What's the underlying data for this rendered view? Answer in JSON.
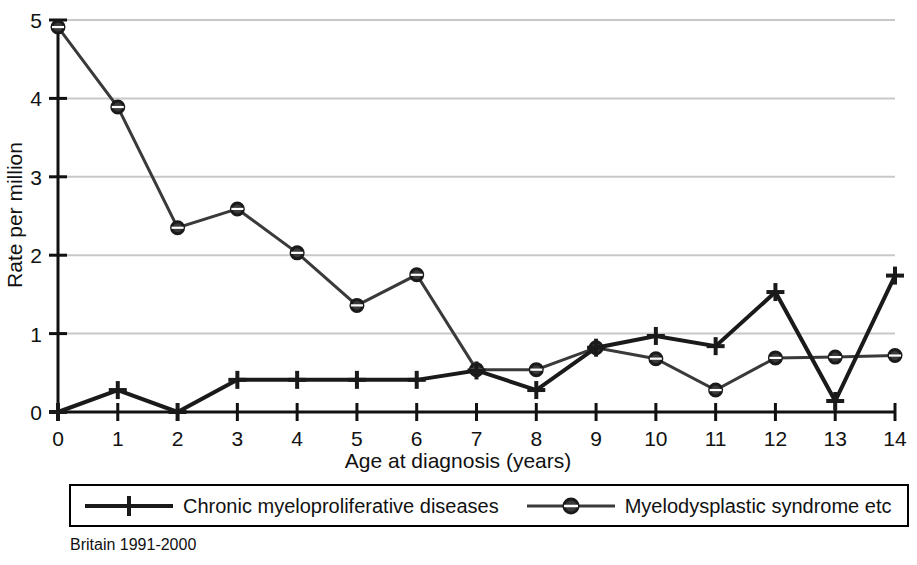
{
  "chart_data": {
    "type": "line",
    "title": "",
    "subtitle": "",
    "xlabel": "Age at diagnosis (years)",
    "ylabel": "Rate per million",
    "x": [
      0,
      1,
      2,
      3,
      4,
      5,
      6,
      7,
      8,
      9,
      10,
      11,
      12,
      13,
      14
    ],
    "categories": [
      "0",
      "1",
      "2",
      "3",
      "4",
      "5",
      "6",
      "7",
      "8",
      "9",
      "10",
      "11",
      "12",
      "13",
      "14"
    ],
    "xlim": [
      0,
      14
    ],
    "ylim": [
      0,
      5
    ],
    "xticks": [
      "0",
      "1",
      "2",
      "3",
      "4",
      "5",
      "6",
      "7",
      "8",
      "9",
      "10",
      "11",
      "12",
      "13",
      "14"
    ],
    "yticks": [
      "0",
      "1",
      "2",
      "3",
      "4",
      "5"
    ],
    "grid": "horizontal",
    "grid_color": "#c8c8c8",
    "legend_position": "below-plot",
    "series": [
      {
        "name": "Chronic myeloproliferative diseases",
        "marker": "plus",
        "color": "#1a1a1a",
        "line_width": 4,
        "values": [
          0.0,
          0.28,
          0.0,
          0.41,
          0.41,
          0.41,
          0.41,
          0.53,
          0.28,
          0.82,
          0.97,
          0.84,
          1.53,
          0.14,
          1.74
        ]
      },
      {
        "name": "Myelodysplastic syndrome etc",
        "marker": "circle-dash",
        "color": "#3a3a3a",
        "line_width": 3,
        "values": [
          4.91,
          3.89,
          2.35,
          2.59,
          2.03,
          1.36,
          1.75,
          0.54,
          0.54,
          0.82,
          0.68,
          0.28,
          0.69,
          0.7,
          0.72
        ]
      }
    ],
    "annotations": [
      "Britain 1991-2000"
    ]
  },
  "axis": {
    "y_title": "Rate per million",
    "x_title": "Age at diagnosis (years)"
  },
  "legend": {
    "entries": [
      {
        "label": "Chronic myeloproliferative diseases",
        "marker": "plus-marker"
      },
      {
        "label": "Myelodysplastic syndrome etc",
        "marker": "circle-marker"
      }
    ]
  },
  "caption": {
    "text": "Britain 1991-2000"
  }
}
